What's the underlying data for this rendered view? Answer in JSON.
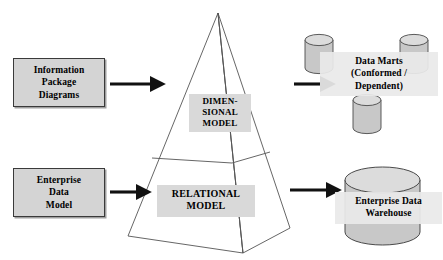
{
  "diagram": {
    "background_color": "#ffffff",
    "box_fill": "#d4d4d4",
    "label_fill": "#d9d9d9",
    "cylinder_fill": "#c8c8c8",
    "cylinder_top_fill": "#dcdcdc",
    "line_color": "#555555",
    "arrow_color": "#111111"
  },
  "sources": [
    {
      "id": "information-package-diagrams",
      "lines": [
        "Information",
        "Package",
        "Diagrams"
      ]
    },
    {
      "id": "enterprise-data-model",
      "lines": [
        "Enterprise",
        "Data",
        "Model"
      ]
    }
  ],
  "pyramid": {
    "tiers": [
      {
        "id": "dimensional-model",
        "lines": [
          "DIMEN-",
          "SIONAL",
          "MODEL"
        ]
      },
      {
        "id": "relational-model",
        "lines": [
          "RELATIONAL",
          "MODEL"
        ]
      }
    ]
  },
  "targets": [
    {
      "id": "data-marts",
      "lines": [
        "Data Marts",
        "(Conformed /",
        "Dependent)"
      ],
      "shape": "three-small-cylinders"
    },
    {
      "id": "enterprise-data-warehouse",
      "lines": [
        "Enterprise Data",
        "Warehouse"
      ],
      "shape": "large-cylinder"
    }
  ],
  "arrows": [
    {
      "id": "arrow-info-to-pyramid",
      "direction": "right"
    },
    {
      "id": "arrow-edm-to-pyramid",
      "direction": "right"
    },
    {
      "id": "arrow-pyramid-to-marts",
      "direction": "right"
    },
    {
      "id": "arrow-pyramid-to-edw",
      "direction": "right"
    }
  ]
}
